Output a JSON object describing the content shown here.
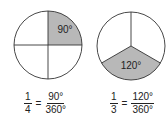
{
  "diagrams": [
    {
      "name": "quarter-circle",
      "parts": 4,
      "shaded_angle_label": "90°",
      "equation": {
        "lhs_num": "1",
        "lhs_den": "4",
        "equals": "=",
        "rhs_num": "90°",
        "rhs_den": "360°"
      }
    },
    {
      "name": "third-circle",
      "parts": 3,
      "shaded_angle_label": "120°",
      "equation": {
        "lhs_num": "1",
        "lhs_den": "3",
        "equals": "=",
        "rhs_num": "120°",
        "rhs_den": "360°"
      }
    }
  ],
  "colors": {
    "shade": "#b8b8b8",
    "stroke": "#333333"
  }
}
